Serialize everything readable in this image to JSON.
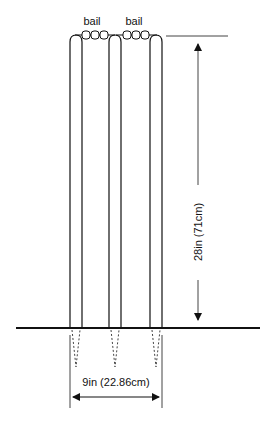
{
  "diagram": {
    "labels": {
      "bail_left": "bail",
      "bail_right": "bail",
      "height": "28in (71cm)",
      "width": "9in (22.86cm)"
    },
    "components": {
      "stumps": 3,
      "bails": 2
    },
    "colors": {
      "line": "#111111",
      "dimension": "#444444",
      "background": "#ffffff"
    }
  }
}
